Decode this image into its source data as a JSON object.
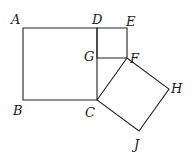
{
  "diagram": {
    "title": "",
    "points": {
      "A": {
        "label": "A",
        "x": 23,
        "y": 28
      },
      "B": {
        "label": "B",
        "x": 23,
        "y": 100
      },
      "C": {
        "label": "C",
        "x": 97,
        "y": 100
      },
      "D": {
        "label": "D",
        "x": 97,
        "y": 28
      },
      "E": {
        "label": "E",
        "x": 127,
        "y": 28
      },
      "F": {
        "label": "F",
        "x": 127,
        "y": 58
      },
      "G": {
        "label": "G",
        "x": 97,
        "y": 58
      },
      "H": {
        "label": "H",
        "x": 169,
        "y": 89
      },
      "J": {
        "label": "J",
        "x": 139,
        "y": 131
      }
    },
    "shapes": [
      {
        "name": "square-ABCD",
        "vertices": [
          "A",
          "B",
          "C",
          "D"
        ]
      },
      {
        "name": "square-DEFG",
        "vertices": [
          "D",
          "E",
          "F",
          "G"
        ]
      },
      {
        "name": "square-CFHJ",
        "vertices": [
          "C",
          "F",
          "H",
          "J"
        ]
      }
    ],
    "stroke_color": "#222222"
  }
}
